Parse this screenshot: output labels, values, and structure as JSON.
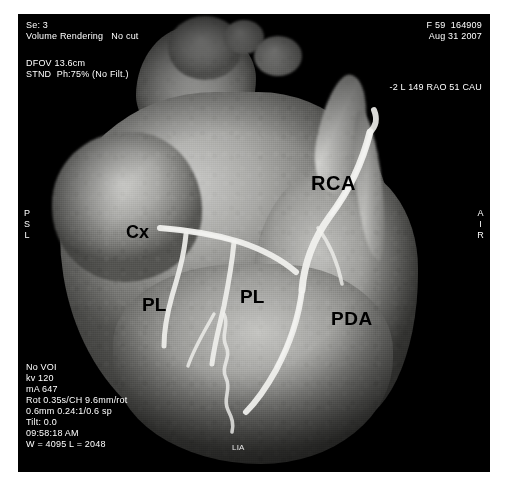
{
  "study": {
    "series": "Se: 3",
    "recon": "Volume Rendering   No cut",
    "dfov": "DFOV 13.6cm",
    "kernel": "STND  Ph:75% (No Filt.)",
    "patient": "F 59  164909",
    "date": "Aug 31 2007",
    "angle": "-2 L 149 RAO 51 CAU"
  },
  "technique": {
    "line1": "No VOI",
    "line2": "kv 120",
    "line3": "mA 647",
    "line4": "Rot 0.35s/CH 9.6mm/rot",
    "line5": "0.6mm 0.24:1/0.6 sp",
    "line6": "Tilt: 0.0",
    "line7": "09:58:18 AM",
    "line8": "W = 4095 L = 2048"
  },
  "orientation": {
    "left": "P\nS\nL",
    "right": "A\nI\nR",
    "footer": "LIA"
  },
  "annotations": {
    "rca": "RCA",
    "cx": "Cx",
    "pl_left": "PL",
    "pl_right": "PL",
    "pda": "PDA"
  },
  "colors": {
    "background": "#ffffff",
    "scan_background": "#000000",
    "overlay_text": "#ffffff",
    "annotation_text": "#000000",
    "vessel": "#f2f2ef"
  }
}
